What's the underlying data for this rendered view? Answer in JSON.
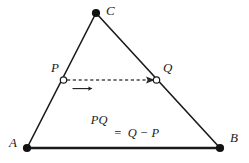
{
  "figure": {
    "kind": "geometry-diagram",
    "title_text": "",
    "background_color": "#ffffff",
    "stroke_color": "#1a1a1a",
    "vertices": [
      {
        "name": "A",
        "label": "A",
        "x": 27,
        "y": 148,
        "marker": "filled-dot",
        "label_x": 9,
        "label_y": 136
      },
      {
        "name": "B",
        "label": "B",
        "x": 220,
        "y": 148,
        "marker": "filled-dot",
        "label_x": 230,
        "label_y": 131
      },
      {
        "name": "C",
        "label": "C",
        "x": 96,
        "y": 13,
        "marker": "filled-dot",
        "label_x": 106,
        "label_y": 4
      },
      {
        "name": "P",
        "label": "P",
        "x": 63,
        "y": 80,
        "marker": "hollow-dot",
        "label_x": 51,
        "label_y": 61
      },
      {
        "name": "Q",
        "label": "Q",
        "x": 156,
        "y": 80,
        "marker": "hollow-dot",
        "label_x": 163,
        "label_y": 61
      }
    ],
    "edges": [
      {
        "name": "edge-AB",
        "from": "A",
        "to": "B",
        "style": "solid",
        "width": 2.4
      },
      {
        "name": "edge-AC",
        "from": "A",
        "to": "C",
        "style": "solid",
        "width": 1.5
      },
      {
        "name": "edge-CB",
        "from": "C",
        "to": "B",
        "style": "solid",
        "width": 1.5
      }
    ],
    "vector_arrow": {
      "name": "vector-PQ",
      "from": "P",
      "to": "Q",
      "style": "dashed",
      "x1": 66,
      "y1": 80,
      "x2": 153,
      "y2": 80,
      "arrowhead": "right"
    },
    "formula": {
      "vector_label": "PQ",
      "equals": "=",
      "right_side": "Q − P",
      "full_text": "PQ = Q − P"
    }
  }
}
